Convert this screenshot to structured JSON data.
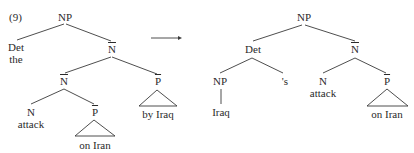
{
  "example_number": "(9)",
  "arrow": {
    "icon": "right-arrow-icon"
  },
  "left_tree": {
    "root": "NP",
    "det": "Det",
    "det_word": "the",
    "nbar_top": "N",
    "nbar_inner": "N",
    "pbar_right": "P",
    "pbar_right_phrase": "by Iraq",
    "n": "N",
    "n_word": "attack",
    "pbar_inner": "P",
    "pbar_inner_phrase": "on Iran"
  },
  "right_tree": {
    "root": "NP",
    "det": "Det",
    "nbar": "N",
    "np": "NP",
    "np_word": "Iraq",
    "possessive": "'s",
    "n": "N",
    "n_word": "attack",
    "pbar": "P",
    "pbar_phrase": "on Iran"
  },
  "colors": {
    "ink": "#2a2a2a",
    "line": "#3a3a3a",
    "background": "#ffffff"
  }
}
